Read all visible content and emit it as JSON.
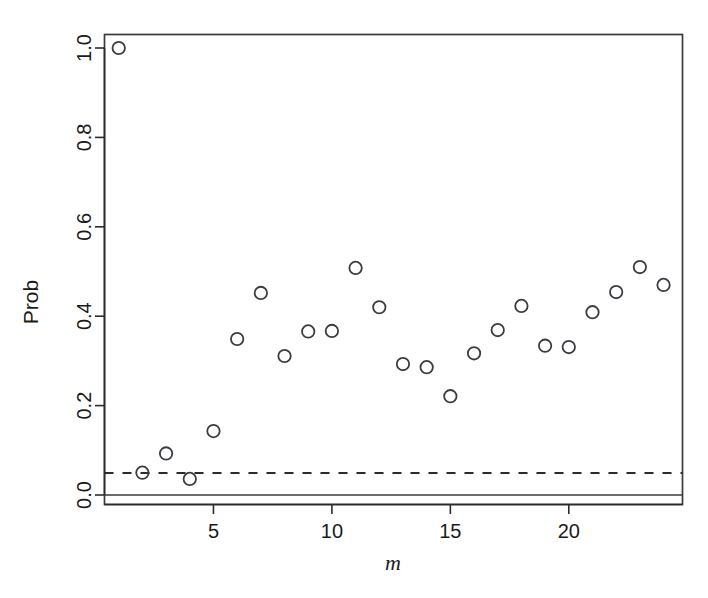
{
  "chart_data": {
    "type": "scatter",
    "title": "",
    "xlabel": "m",
    "ylabel": "Prob",
    "xlim": [
      0.4,
      24.8
    ],
    "ylim": [
      -0.035,
      1.06
    ],
    "grid": false,
    "legend": null,
    "x": [
      1,
      2,
      3,
      4,
      5,
      6,
      7,
      8,
      9,
      10,
      11,
      12,
      13,
      14,
      15,
      16,
      17,
      18,
      19,
      20,
      21,
      22,
      23,
      24
    ],
    "values": [
      1.0,
      0.05,
      0.093,
      0.036,
      0.143,
      0.349,
      0.452,
      0.311,
      0.366,
      0.367,
      0.508,
      0.42,
      0.293,
      0.286,
      0.221,
      0.317,
      0.369,
      0.423,
      0.334,
      0.331,
      0.409,
      0.454,
      0.51,
      0.47
    ],
    "xticks": [
      5,
      10,
      15,
      20
    ],
    "xtick_labels": [
      "5",
      "10",
      "15",
      "20"
    ],
    "yticks": [
      0.0,
      0.2,
      0.4,
      0.6,
      0.8,
      1.0
    ],
    "ytick_labels": [
      "0.0",
      "0.2",
      "0.4",
      "0.6",
      "0.8",
      "1.0"
    ],
    "marker": "open-circle",
    "marker_color": "#3b3b42",
    "reference_lines": [
      {
        "name": "significance-threshold",
        "orientation": "horizontal",
        "y": 0.049,
        "style": "dashed",
        "color": "#2b2b2b"
      },
      {
        "name": "zero-baseline",
        "orientation": "horizontal",
        "y": 0.0,
        "style": "solid",
        "color": "#3a3a3a"
      }
    ]
  },
  "axes": {
    "y_title": "Prob",
    "x_title": "m"
  }
}
